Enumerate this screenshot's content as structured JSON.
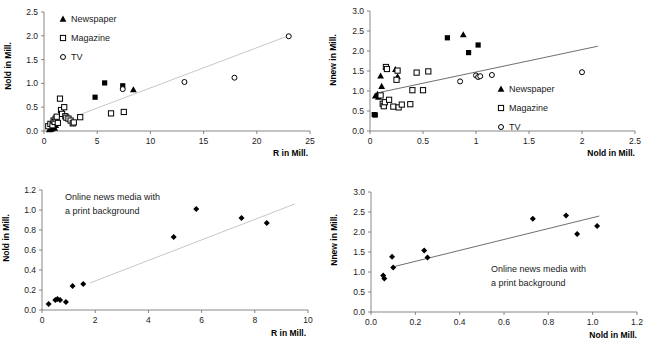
{
  "figure": {
    "panel_count": 4
  },
  "panels": [
    {
      "id": "panel-top-left",
      "xlabel": "R in Mill.",
      "ylabel": "Nold in Mill.",
      "xticks": [
        "0",
        "5",
        "10",
        "15",
        "20",
        "25"
      ],
      "yticks": [
        "0.0",
        "0.5",
        "1.0",
        "1.5",
        "2.0",
        "2.5"
      ],
      "legend": [
        {
          "marker": "triangle",
          "label": "Newspaper"
        },
        {
          "marker": "square-open",
          "label": "Magazine"
        },
        {
          "marker": "circle-open",
          "label": "TV"
        }
      ],
      "annotation": ""
    },
    {
      "id": "panel-top-right",
      "xlabel": "Nold in Mill.",
      "ylabel": "Nnew in Mill.",
      "xticks": [
        "0",
        "0.5",
        "1",
        "1.5",
        "2",
        "2.5"
      ],
      "yticks": [
        "0.0",
        "0.5",
        "1.0",
        "1.5",
        "2.0",
        "2.5",
        "3.0"
      ],
      "legend": [
        {
          "marker": "triangle",
          "label": "Newspaper"
        },
        {
          "marker": "square-open",
          "label": "Magazine"
        },
        {
          "marker": "circle-open",
          "label": "TV"
        }
      ],
      "annotation": ""
    },
    {
      "id": "panel-bottom-left",
      "xlabel": "R in Mill.",
      "ylabel": "Nold in Mill.",
      "xticks": [
        "0",
        "2",
        "4",
        "6",
        "8",
        "10"
      ],
      "yticks": [
        "0.0",
        "0.2",
        "0.4",
        "0.6",
        "0.8",
        "1.0",
        "1.2"
      ],
      "legend": [],
      "annotation_line1": "Online news media with",
      "annotation_line2": "a print background"
    },
    {
      "id": "panel-bottom-right",
      "xlabel": "Nold in Mill.",
      "ylabel": "Nnew in Mill.",
      "xticks": [
        "0.0",
        "0.2",
        "0.4",
        "0.6",
        "0.8",
        "1.0",
        "1.2"
      ],
      "yticks": [
        "0.0",
        "0.5",
        "1.0",
        "1.5",
        "2.0",
        "2.5",
        "3.0"
      ],
      "legend": [],
      "annotation_line1": "Online news media with",
      "annotation_line2": "a print background"
    }
  ],
  "chart_data": [
    {
      "type": "scatter",
      "id": "panel-top-left",
      "title": "",
      "xlabel": "R in Mill.",
      "ylabel": "Nold in Mill.",
      "xlim": [
        0,
        25
      ],
      "ylim": [
        0.0,
        2.5
      ],
      "xticks": [
        0,
        5,
        10,
        15,
        20,
        25
      ],
      "yticks": [
        0.0,
        0.5,
        1.0,
        1.5,
        2.0,
        2.5
      ],
      "grid": false,
      "legend_position": "upper-left",
      "trendline": {
        "x": [
          3.2,
          23.2
        ],
        "y": [
          0.33,
          2.02
        ]
      },
      "series": [
        {
          "name": "Newspaper",
          "marker": "triangle",
          "points": [
            [
              0.5,
              0.03
            ],
            [
              0.6,
              0.05
            ],
            [
              0.7,
              0.04
            ],
            [
              0.8,
              0.07
            ],
            [
              0.9,
              0.09
            ],
            [
              1.0,
              0.06
            ],
            [
              1.1,
              0.12
            ],
            [
              8.4,
              0.87
            ]
          ]
        },
        {
          "name": "Magazine",
          "marker": "square-open",
          "points": [
            [
              0.4,
              0.1
            ],
            [
              0.6,
              0.15
            ],
            [
              0.8,
              0.12
            ],
            [
              0.9,
              0.22
            ],
            [
              1.0,
              0.19
            ],
            [
              1.1,
              0.26
            ],
            [
              1.2,
              0.3
            ],
            [
              1.3,
              0.17
            ],
            [
              1.5,
              0.68
            ],
            [
              1.6,
              0.44
            ],
            [
              1.7,
              0.36
            ],
            [
              1.9,
              0.5
            ],
            [
              2.0,
              0.31
            ],
            [
              2.1,
              0.28
            ],
            [
              2.3,
              0.26
            ],
            [
              2.5,
              0.22
            ],
            [
              2.7,
              0.16
            ],
            [
              2.8,
              0.18
            ],
            [
              3.4,
              0.29
            ],
            [
              6.3,
              0.37
            ],
            [
              7.5,
              0.4
            ],
            [
              4.8,
              0.71
            ],
            [
              5.7,
              1.01
            ],
            [
              7.4,
              0.95
            ]
          ]
        },
        {
          "name": "TV",
          "marker": "circle-open",
          "points": [
            [
              7.4,
              0.88
            ],
            [
              13.2,
              1.03
            ],
            [
              17.9,
              1.12
            ],
            [
              23.0,
              1.99
            ]
          ]
        }
      ]
    },
    {
      "type": "scatter",
      "id": "panel-top-right",
      "title": "",
      "xlabel": "Nold in Mill.",
      "ylabel": "Nnew in Mill.",
      "xlim": [
        0,
        2.5
      ],
      "ylim": [
        0.0,
        3.0
      ],
      "xticks": [
        0,
        0.5,
        1,
        1.5,
        2,
        2.5
      ],
      "yticks": [
        0.0,
        0.5,
        1.0,
        1.5,
        2.0,
        2.5,
        3.0
      ],
      "grid": false,
      "legend_position": "lower-right",
      "trendline": {
        "x": [
          0.1,
          2.15
        ],
        "y": [
          0.97,
          2.12
        ]
      },
      "series": [
        {
          "name": "Newspaper",
          "marker": "triangle",
          "points": [
            [
              0.05,
              0.88
            ],
            [
              0.07,
              0.92
            ],
            [
              0.08,
              0.85
            ],
            [
              0.1,
              1.38
            ],
            [
              0.11,
              1.12
            ],
            [
              0.24,
              1.54
            ],
            [
              0.26,
              1.36
            ],
            [
              0.88,
              2.41
            ]
          ]
        },
        {
          "name": "Magazine",
          "marker": "square-open",
          "points": [
            [
              0.04,
              0.41
            ],
            [
              0.05,
              0.4
            ],
            [
              0.1,
              0.89
            ],
            [
              0.12,
              0.68
            ],
            [
              0.13,
              0.62
            ],
            [
              0.14,
              0.72
            ],
            [
              0.15,
              1.6
            ],
            [
              0.16,
              1.55
            ],
            [
              0.18,
              0.78
            ],
            [
              0.22,
              0.61
            ],
            [
              0.25,
              1.28
            ],
            [
              0.26,
              1.51
            ],
            [
              0.27,
              0.59
            ],
            [
              0.3,
              0.66
            ],
            [
              0.38,
              0.67
            ],
            [
              0.4,
              1.02
            ],
            [
              0.44,
              1.46
            ],
            [
              0.5,
              1.02
            ],
            [
              0.55,
              1.49
            ],
            [
              0.73,
              2.33
            ],
            [
              0.93,
              1.96
            ],
            [
              1.02,
              2.15
            ]
          ]
        },
        {
          "name": "TV",
          "marker": "circle-open",
          "points": [
            [
              0.85,
              1.24
            ],
            [
              1.0,
              1.39
            ],
            [
              1.02,
              1.35
            ],
            [
              1.04,
              1.37
            ],
            [
              1.15,
              1.4
            ],
            [
              2.0,
              1.47
            ]
          ]
        }
      ]
    },
    {
      "type": "scatter",
      "id": "panel-bottom-left",
      "title": "",
      "annotation": "Online news media with a print background",
      "xlabel": "R in Mill.",
      "ylabel": "Nold in Mill.",
      "xlim": [
        0,
        10
      ],
      "ylim": [
        0.0,
        1.2
      ],
      "xticks": [
        0,
        2,
        4,
        6,
        8,
        10
      ],
      "yticks": [
        0.0,
        0.2,
        0.4,
        0.6,
        0.8,
        1.0,
        1.2
      ],
      "grid": false,
      "legend_position": "none",
      "trendline": {
        "x": [
          1.8,
          9.5
        ],
        "y": [
          0.27,
          1.06
        ]
      },
      "series": [
        {
          "name": "Online news media with a print background",
          "marker": "diamond",
          "points": [
            [
              0.25,
              0.06
            ],
            [
              0.5,
              0.1
            ],
            [
              0.58,
              0.11
            ],
            [
              0.68,
              0.1
            ],
            [
              0.9,
              0.08
            ],
            [
              1.15,
              0.24
            ],
            [
              1.55,
              0.26
            ],
            [
              4.95,
              0.73
            ],
            [
              5.8,
              1.01
            ],
            [
              7.5,
              0.92
            ],
            [
              8.45,
              0.87
            ]
          ]
        }
      ]
    },
    {
      "type": "scatter",
      "id": "panel-bottom-right",
      "title": "",
      "annotation": "Online news media with a print background",
      "xlabel": "Nold in Mill.",
      "ylabel": "Nnew in Mill.",
      "xlim": [
        0.0,
        1.2
      ],
      "ylim": [
        0.0,
        3.0
      ],
      "xticks": [
        0.0,
        0.2,
        0.4,
        0.6,
        0.8,
        1.0,
        1.2
      ],
      "yticks": [
        0.0,
        0.5,
        1.0,
        1.5,
        2.0,
        2.5,
        3.0
      ],
      "grid": false,
      "legend_position": "none",
      "trendline": {
        "x": [
          0.1,
          1.03
        ],
        "y": [
          1.13,
          2.4
        ]
      },
      "series": [
        {
          "name": "Online news media with a print background",
          "marker": "diamond",
          "points": [
            [
              0.055,
              0.91
            ],
            [
              0.06,
              0.84
            ],
            [
              0.095,
              1.38
            ],
            [
              0.1,
              1.11
            ],
            [
              0.24,
              1.54
            ],
            [
              0.255,
              1.36
            ],
            [
              0.73,
              2.33
            ],
            [
              0.88,
              2.41
            ],
            [
              0.93,
              1.95
            ],
            [
              1.02,
              2.15
            ]
          ]
        }
      ]
    }
  ]
}
